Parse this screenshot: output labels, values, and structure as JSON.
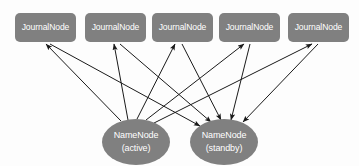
{
  "diagram": {
    "background_color": "#fdfdfd",
    "node_fill_color": "#808080",
    "node_text_color": "#ffffff",
    "edge_color": "#1a1a1a",
    "journal_nodes": [
      {
        "id": "jn1",
        "label": "JournalNode",
        "x": 15,
        "y": 13,
        "w": 61,
        "h": 29
      },
      {
        "id": "jn2",
        "label": "JournalNode",
        "x": 85,
        "y": 13,
        "w": 61,
        "h": 29
      },
      {
        "id": "jn3",
        "label": "JournalNode",
        "x": 152,
        "y": 13,
        "w": 61,
        "h": 29
      },
      {
        "id": "jn4",
        "label": "JournalNode",
        "x": 219,
        "y": 13,
        "w": 61,
        "h": 29
      },
      {
        "id": "jn5",
        "label": "JournalNode",
        "x": 288,
        "y": 13,
        "w": 61,
        "h": 29
      }
    ],
    "name_nodes": [
      {
        "id": "nn-active",
        "line1": "NameNode",
        "line2": "(active)",
        "cx": 136,
        "cy": 142,
        "rx": 34,
        "ry": 23
      },
      {
        "id": "nn-standby",
        "line1": "NameNode",
        "line2": "(standby)",
        "cx": 224,
        "cy": 142,
        "rx": 34,
        "ry": 23
      }
    ],
    "edges": [
      {
        "from": "nn-active",
        "to": "jn1",
        "x1": 121,
        "y1": 121,
        "x2": 46,
        "y2": 44,
        "arrow": "end"
      },
      {
        "from": "nn-active",
        "to": "jn2",
        "x1": 128,
        "y1": 120,
        "x2": 114,
        "y2": 44,
        "arrow": "end"
      },
      {
        "from": "nn-active",
        "to": "jn3",
        "x1": 137,
        "y1": 119,
        "x2": 175,
        "y2": 44,
        "arrow": "end"
      },
      {
        "from": "nn-active",
        "to": "jn4",
        "x1": 146,
        "y1": 120,
        "x2": 244,
        "y2": 44,
        "arrow": "end"
      },
      {
        "from": "nn-active",
        "to": "jn5",
        "x1": 154,
        "y1": 123,
        "x2": 312,
        "y2": 44,
        "arrow": "end"
      },
      {
        "from": "jn1",
        "to": "nn-standby",
        "x1": 50,
        "y1": 44,
        "x2": 200,
        "y2": 126,
        "arrow": "end"
      },
      {
        "from": "jn2",
        "to": "nn-standby",
        "x1": 120,
        "y1": 44,
        "x2": 211,
        "y2": 122,
        "arrow": "end"
      },
      {
        "from": "jn3",
        "to": "nn-standby",
        "x1": 182,
        "y1": 44,
        "x2": 221,
        "y2": 120,
        "arrow": "end"
      },
      {
        "from": "jn4",
        "to": "nn-standby",
        "x1": 250,
        "y1": 44,
        "x2": 231,
        "y2": 120,
        "arrow": "end"
      },
      {
        "from": "jn5",
        "to": "nn-standby",
        "x1": 318,
        "y1": 44,
        "x2": 243,
        "y2": 122,
        "arrow": "end"
      }
    ]
  }
}
